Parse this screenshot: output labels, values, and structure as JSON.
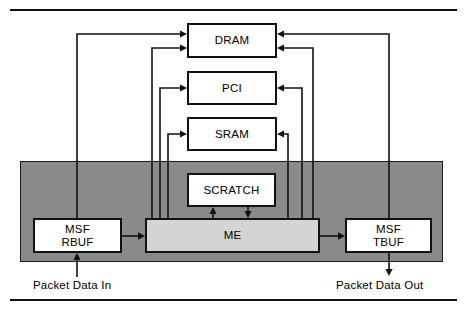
{
  "figure": {
    "title": "",
    "colors": {
      "band_fill": "#8a8a8a",
      "box_fill": "#ffffff",
      "me_fill": "#d4d4d4",
      "stroke": "#111111",
      "background": "#ffffff"
    }
  },
  "blocks": {
    "dram": {
      "label": "DRAM"
    },
    "pci": {
      "label": "PCI"
    },
    "sram": {
      "label": "SRAM"
    },
    "scratch": {
      "label": "SCRATCH"
    },
    "me": {
      "label": "ME"
    },
    "rbuf": {
      "label": "MSF\nRBUF",
      "line1": "MSF",
      "line2": "RBUF"
    },
    "tbuf": {
      "label": "MSF\nTBUF",
      "line1": "MSF",
      "line2": "TBUF"
    }
  },
  "captions": {
    "packet_in": "Packet Data In",
    "packet_out": "Packet Data Out"
  },
  "connections": [
    {
      "from": "rbuf",
      "to": "dram",
      "direction": "up-left-to-top"
    },
    {
      "from": "me",
      "to": "dram",
      "direction": "up-left"
    },
    {
      "from": "me",
      "to": "pci",
      "direction": "up-left"
    },
    {
      "from": "me",
      "to": "sram",
      "direction": "up-left"
    },
    {
      "from": "dram",
      "to": "me",
      "direction": "down-right"
    },
    {
      "from": "pci",
      "to": "me",
      "direction": "down-right"
    },
    {
      "from": "sram",
      "to": "me",
      "direction": "down-right"
    },
    {
      "from": "tbuf",
      "to": "dram",
      "direction": "up-right"
    },
    {
      "from": "rbuf",
      "to": "me",
      "direction": "right"
    },
    {
      "from": "me",
      "to": "tbuf",
      "direction": "right"
    },
    {
      "from": "scratch",
      "to": "me",
      "direction": "down"
    },
    {
      "from": "me",
      "to": "scratch",
      "direction": "up"
    },
    {
      "from": "packet_in",
      "to": "rbuf",
      "direction": "up"
    },
    {
      "from": "tbuf",
      "to": "packet_out",
      "direction": "down"
    }
  ]
}
